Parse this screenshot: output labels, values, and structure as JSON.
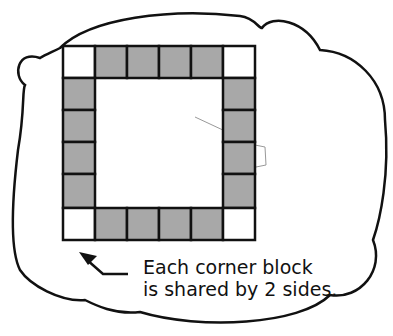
{
  "diagram": {
    "grid": {
      "cells_per_side": 6,
      "corner_color": "#ffffff",
      "edge_color": "#a8a8a8",
      "line_color": "#111111"
    },
    "caption": {
      "line1": "Each corner block",
      "line2": "is shared by 2 sides."
    },
    "arrow": "arrow-pointing-to-bottom-left-corner"
  }
}
